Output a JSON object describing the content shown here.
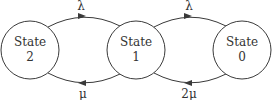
{
  "diagram": {
    "type": "state-transition",
    "states": [
      {
        "id": "s2",
        "line1": "State",
        "line2": "2"
      },
      {
        "id": "s1",
        "line1": "State",
        "line2": "1"
      },
      {
        "id": "s0",
        "line1": "State",
        "line2": "0"
      }
    ],
    "transitions": [
      {
        "from": "s2",
        "to": "s1",
        "label": "λ"
      },
      {
        "from": "s1",
        "to": "s0",
        "label": "λ"
      },
      {
        "from": "s1",
        "to": "s2",
        "label": "μ"
      },
      {
        "from": "s0",
        "to": "s1",
        "label": "2μ"
      }
    ]
  }
}
